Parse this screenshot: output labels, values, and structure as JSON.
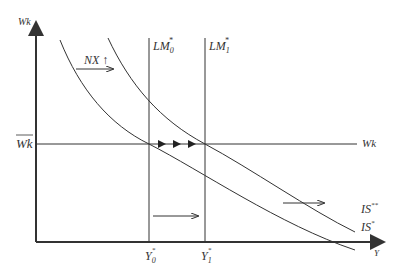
{
  "diagram": {
    "type": "Mundell-Fleming IS*-LM* diagram",
    "y_axis_label": "Wk",
    "x_axis_label": "Y",
    "horizontal_line_label": "Wk",
    "horizontal_line_left_label": "Wk",
    "lm0_label": "LM",
    "lm0_sub": "0",
    "lm1_label": "LM",
    "lm1_sub": "1",
    "star": "*",
    "is_label": "IS",
    "is_sup": "*",
    "is2_label": "IS",
    "is2_sup": "**",
    "nx_label": "NX",
    "nx_arrow": "↑",
    "y0_label": "Y",
    "y0_sub": "0",
    "y1_label": "Y",
    "y1_sub": "1",
    "colors": {
      "line": "#333333",
      "background": "#ffffff"
    }
  }
}
